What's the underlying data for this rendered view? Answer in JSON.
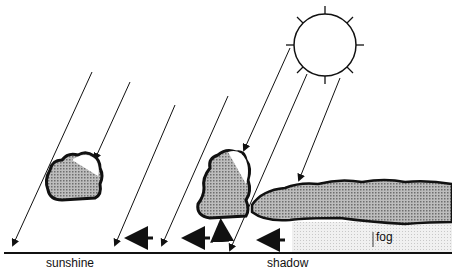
{
  "diagram": {
    "labels": {
      "left": "sunshine",
      "right": "shadow",
      "fog": "fog"
    },
    "elements": [
      "sun",
      "sun-rays",
      "cumulus-cloud-small",
      "cumulus-cloud-tall",
      "stratus-cloud-layer",
      "fog-bank",
      "wind-arrows",
      "updraft-arrow",
      "ground-line"
    ],
    "colors": {
      "line": "#111111",
      "cloud_fill": "#9a9a9a",
      "fog_fill": "#e2e2e2",
      "background": "#ffffff"
    }
  }
}
